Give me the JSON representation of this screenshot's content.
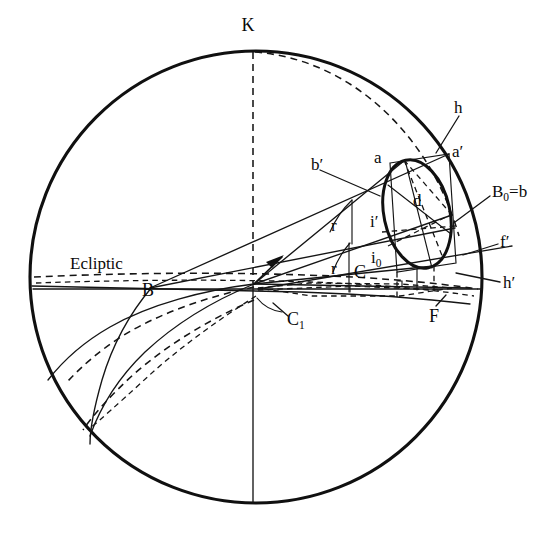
{
  "figure": {
    "kind": "geometric-astronomy-diagram",
    "background_color": "#ffffff",
    "line_color": "#101010",
    "width": 558,
    "height": 553
  },
  "labels": {
    "k": "K",
    "ecliptic": "Ecliptic",
    "b_point": "B",
    "c1": "C",
    "c1_sub": "1",
    "c": "C",
    "r_upper": "r",
    "r_lower": "r",
    "i_prime": "i′",
    "i0": "i",
    "i0_sub": "0",
    "d": "d",
    "a": "a",
    "a_prime": "a′",
    "b_prime": "b′",
    "h": "h",
    "h_prime": "h′",
    "f_prime": "f′",
    "f": "F",
    "b0_eq_b": "B",
    "b0_sub": "0",
    "b0_tail": "=b"
  },
  "geometry": {
    "sphere_center": {
      "x": 256,
      "y": 277
    },
    "sphere_radius": 226,
    "ellipse_center": {
      "x": 417,
      "y": 214
    },
    "ellipse_rx": 33,
    "ellipse_ry": 55,
    "ellipse_rotation_deg": -12,
    "origin_vertex": {
      "x": 254,
      "y": 284
    },
    "b_node": {
      "x": 151,
      "y": 288
    }
  }
}
